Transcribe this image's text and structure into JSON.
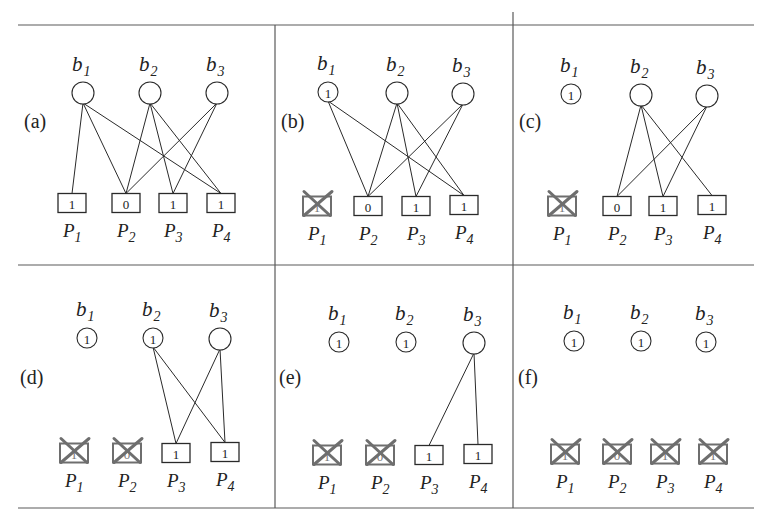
{
  "figure": {
    "frame": {
      "top_y": 25,
      "middle_y": 265,
      "bottom_y": 508,
      "left_x": 18,
      "right_x": 754,
      "vertical_x": [
        275,
        513
      ],
      "vertical_extend_top": 12
    },
    "colors": {
      "line": "#2a2a2a",
      "removed": "#6e6e6e",
      "frame": "#5a5a5a"
    },
    "panels": [
      {
        "id": "a",
        "label": "(a)",
        "label_pos": [
          24,
          128
        ],
        "b_nodes": [
          {
            "name": "b",
            "sub": "1",
            "cx": 83,
            "cy": 93,
            "r": 11,
            "value": ""
          },
          {
            "name": "b",
            "sub": "2",
            "cx": 150,
            "cy": 93,
            "r": 11,
            "value": ""
          },
          {
            "name": "b",
            "sub": "3",
            "cx": 217,
            "cy": 93,
            "r": 11,
            "value": ""
          }
        ],
        "p_nodes": [
          {
            "name": "P",
            "sub": "1",
            "cx": 72,
            "cy": 203,
            "value": "1",
            "removed": false
          },
          {
            "name": "P",
            "sub": "2",
            "cx": 126,
            "cy": 203,
            "value": "0",
            "removed": false
          },
          {
            "name": "P",
            "sub": "3",
            "cx": 173,
            "cy": 203,
            "value": "1",
            "removed": false
          },
          {
            "name": "P",
            "sub": "4",
            "cx": 221,
            "cy": 203,
            "value": "1",
            "removed": false
          }
        ],
        "edges": [
          [
            0,
            0
          ],
          [
            0,
            1
          ],
          [
            0,
            3
          ],
          [
            1,
            1
          ],
          [
            1,
            2
          ],
          [
            1,
            3
          ],
          [
            2,
            1
          ],
          [
            2,
            2
          ]
        ]
      },
      {
        "id": "b",
        "label": "(b)",
        "label_pos": [
          281,
          128
        ],
        "b_nodes": [
          {
            "name": "b",
            "sub": "1",
            "cx": 328,
            "cy": 92,
            "r": 10,
            "value": "1"
          },
          {
            "name": "b",
            "sub": "2",
            "cx": 397,
            "cy": 93,
            "r": 11,
            "value": ""
          },
          {
            "name": "b",
            "sub": "3",
            "cx": 463,
            "cy": 94,
            "r": 11,
            "value": ""
          }
        ],
        "p_nodes": [
          {
            "name": "P",
            "sub": "1",
            "cx": 317,
            "cy": 206,
            "value": "1",
            "removed": true
          },
          {
            "name": "P",
            "sub": "2",
            "cx": 368,
            "cy": 206,
            "value": "0",
            "removed": false
          },
          {
            "name": "P",
            "sub": "3",
            "cx": 416,
            "cy": 206,
            "value": "1",
            "removed": false
          },
          {
            "name": "P",
            "sub": "4",
            "cx": 464,
            "cy": 205,
            "value": "1",
            "removed": false
          }
        ],
        "edges": [
          [
            0,
            1
          ],
          [
            0,
            3
          ],
          [
            1,
            1
          ],
          [
            1,
            2
          ],
          [
            1,
            3
          ],
          [
            2,
            1
          ],
          [
            2,
            2
          ]
        ]
      },
      {
        "id": "c",
        "label": "(c)",
        "label_pos": [
          519,
          128
        ],
        "b_nodes": [
          {
            "name": "b",
            "sub": "1",
            "cx": 571,
            "cy": 94,
            "r": 10,
            "value": "1"
          },
          {
            "name": "b",
            "sub": "2",
            "cx": 641,
            "cy": 95,
            "r": 11,
            "value": ""
          },
          {
            "name": "b",
            "sub": "3",
            "cx": 707,
            "cy": 96,
            "r": 11,
            "value": ""
          }
        ],
        "p_nodes": [
          {
            "name": "P",
            "sub": "1",
            "cx": 562,
            "cy": 206,
            "value": "1",
            "removed": true
          },
          {
            "name": "P",
            "sub": "2",
            "cx": 617,
            "cy": 206,
            "value": "0",
            "removed": false
          },
          {
            "name": "P",
            "sub": "3",
            "cx": 663,
            "cy": 206,
            "value": "1",
            "removed": false
          },
          {
            "name": "P",
            "sub": "4",
            "cx": 712,
            "cy": 205,
            "value": "1",
            "removed": false
          }
        ],
        "edges": [
          [
            1,
            1
          ],
          [
            1,
            2
          ],
          [
            1,
            3
          ],
          [
            2,
            1
          ],
          [
            2,
            2
          ]
        ]
      },
      {
        "id": "d",
        "label": "(d)",
        "label_pos": [
          20,
          384
        ],
        "b_nodes": [
          {
            "name": "b",
            "sub": "1",
            "cx": 87,
            "cy": 338,
            "r": 10,
            "value": "1"
          },
          {
            "name": "b",
            "sub": "2",
            "cx": 153,
            "cy": 338,
            "r": 10,
            "value": "1"
          },
          {
            "name": "b",
            "sub": "3",
            "cx": 220,
            "cy": 339,
            "r": 11,
            "value": ""
          }
        ],
        "p_nodes": [
          {
            "name": "P",
            "sub": "1",
            "cx": 74,
            "cy": 453,
            "value": "1",
            "removed": true
          },
          {
            "name": "P",
            "sub": "2",
            "cx": 127,
            "cy": 453,
            "value": "0",
            "removed": true
          },
          {
            "name": "P",
            "sub": "3",
            "cx": 176,
            "cy": 453,
            "value": "1",
            "removed": false
          },
          {
            "name": "P",
            "sub": "4",
            "cx": 225,
            "cy": 452,
            "value": "1",
            "removed": false
          }
        ],
        "edges": [
          [
            1,
            2
          ],
          [
            1,
            3
          ],
          [
            2,
            2
          ],
          [
            2,
            3
          ]
        ]
      },
      {
        "id": "e",
        "label": "(e)",
        "label_pos": [
          279,
          384
        ],
        "b_nodes": [
          {
            "name": "b",
            "sub": "1",
            "cx": 339,
            "cy": 342,
            "r": 10,
            "value": "1"
          },
          {
            "name": "b",
            "sub": "2",
            "cx": 406,
            "cy": 342,
            "r": 10,
            "value": "1"
          },
          {
            "name": "b",
            "sub": "3",
            "cx": 474,
            "cy": 343,
            "r": 11,
            "value": ""
          }
        ],
        "p_nodes": [
          {
            "name": "P",
            "sub": "1",
            "cx": 327,
            "cy": 455,
            "value": "1",
            "removed": true
          },
          {
            "name": "P",
            "sub": "2",
            "cx": 380,
            "cy": 455,
            "value": "0",
            "removed": true
          },
          {
            "name": "P",
            "sub": "3",
            "cx": 429,
            "cy": 455,
            "value": "1",
            "removed": false
          },
          {
            "name": "P",
            "sub": "4",
            "cx": 478,
            "cy": 454,
            "value": "1",
            "removed": false
          }
        ],
        "edges": [
          [
            2,
            2
          ],
          [
            2,
            3
          ]
        ]
      },
      {
        "id": "f",
        "label": "(f)",
        "label_pos": [
          518,
          384
        ],
        "b_nodes": [
          {
            "name": "b",
            "sub": "1",
            "cx": 574,
            "cy": 341,
            "r": 10,
            "value": "1"
          },
          {
            "name": "b",
            "sub": "2",
            "cx": 641,
            "cy": 341,
            "r": 10,
            "value": "1"
          },
          {
            "name": "b",
            "sub": "3",
            "cx": 706,
            "cy": 342,
            "r": 10,
            "value": "1"
          }
        ],
        "p_nodes": [
          {
            "name": "P",
            "sub": "1",
            "cx": 565,
            "cy": 454,
            "value": "1",
            "removed": true
          },
          {
            "name": "P",
            "sub": "2",
            "cx": 617,
            "cy": 454,
            "value": "0",
            "removed": true
          },
          {
            "name": "P",
            "sub": "3",
            "cx": 665,
            "cy": 454,
            "value": "1",
            "removed": true
          },
          {
            "name": "P",
            "sub": "4",
            "cx": 713,
            "cy": 454,
            "value": "1",
            "removed": true
          }
        ],
        "edges": []
      }
    ]
  }
}
